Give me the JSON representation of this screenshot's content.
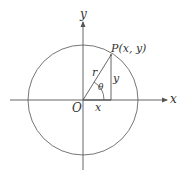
{
  "diagram": {
    "type": "unit-circle-polar-coordinates",
    "axes": {
      "x_label": "x",
      "y_label": "y",
      "origin_label": "O"
    },
    "point": {
      "label": "P(x, y)"
    },
    "segments": {
      "radius_label": "r",
      "vertical_label": "y",
      "horizontal_label": "x"
    },
    "angle": {
      "label": "θ"
    },
    "colors": {
      "stroke": "#555555",
      "text": "#333333",
      "background": "#ffffff"
    }
  }
}
